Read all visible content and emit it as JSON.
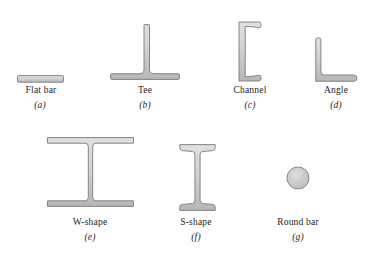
{
  "figure": {
    "colors": {
      "background": "#ffffff",
      "shape_fill_light": "#dddddd",
      "shape_fill_mid": "#cfcfcf",
      "shape_fill_dark": "#b6b6b6",
      "shape_outline": "#7a7a7a",
      "label_text": "#1c1c1c"
    },
    "items": [
      {
        "id": "flat-bar",
        "label": "Flat bar",
        "letter": "(a)"
      },
      {
        "id": "tee",
        "label": "Tee",
        "letter": "(b)"
      },
      {
        "id": "channel",
        "label": "Channel",
        "letter": "(c)"
      },
      {
        "id": "angle",
        "label": "Angle",
        "letter": "(d)"
      },
      {
        "id": "w-shape",
        "label": "W-shape",
        "letter": "(e)"
      },
      {
        "id": "s-shape",
        "label": "S-shape",
        "letter": "(f)"
      },
      {
        "id": "round-bar",
        "label": "Round bar",
        "letter": "(g)"
      }
    ]
  }
}
